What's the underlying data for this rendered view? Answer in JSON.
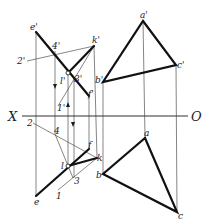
{
  "diagram": {
    "axis": {
      "left_label": "X",
      "right_label": "O",
      "y": 116,
      "x1": 22,
      "x2": 188
    },
    "colors": {
      "stroke": "#1a1a1a",
      "thin": "#333333",
      "background": "#ffffff"
    },
    "front_view": {
      "points": {
        "e_prime": {
          "label": "e'",
          "x": 36,
          "y": 32
        },
        "k_prime": {
          "label": "k'",
          "x": 94,
          "y": 46
        },
        "four_prime": {
          "label": "4'",
          "x": 55,
          "y": 51
        },
        "two_prime": {
          "label": "2'",
          "x": 27,
          "y": 61
        },
        "l_prime": {
          "label": "l'",
          "x": 68,
          "y": 73
        },
        "three_prime": {
          "label": "3'",
          "x": 74,
          "y": 78
        },
        "f_prime": {
          "label": "f'",
          "x": 89,
          "y": 96
        },
        "one_prime": {
          "label": "1'",
          "x": 58,
          "y": 106
        },
        "a_prime": {
          "label": "a'",
          "x": 143,
          "y": 21
        },
        "b_prime": {
          "label": "b'",
          "x": 103,
          "y": 82
        },
        "c_prime": {
          "label": "c'",
          "x": 176,
          "y": 65
        }
      }
    },
    "top_view": {
      "points": {
        "e": {
          "label": "e",
          "x": 36,
          "y": 196
        },
        "f": {
          "label": "f",
          "x": 89,
          "y": 149
        },
        "k": {
          "label": "k",
          "x": 97,
          "y": 158
        },
        "l": {
          "label": "l",
          "x": 68,
          "y": 166
        },
        "four": {
          "label": "4",
          "x": 55,
          "y": 134
        },
        "two": {
          "label": "2",
          "x": 33,
          "y": 123
        },
        "three": {
          "label": "3",
          "x": 73,
          "y": 178
        },
        "one": {
          "label": "1",
          "x": 58,
          "y": 190
        },
        "a": {
          "label": "a",
          "x": 145,
          "y": 138
        },
        "b": {
          "label": "b",
          "x": 103,
          "y": 174
        },
        "c": {
          "label": "c",
          "x": 177,
          "y": 212
        }
      }
    }
  }
}
